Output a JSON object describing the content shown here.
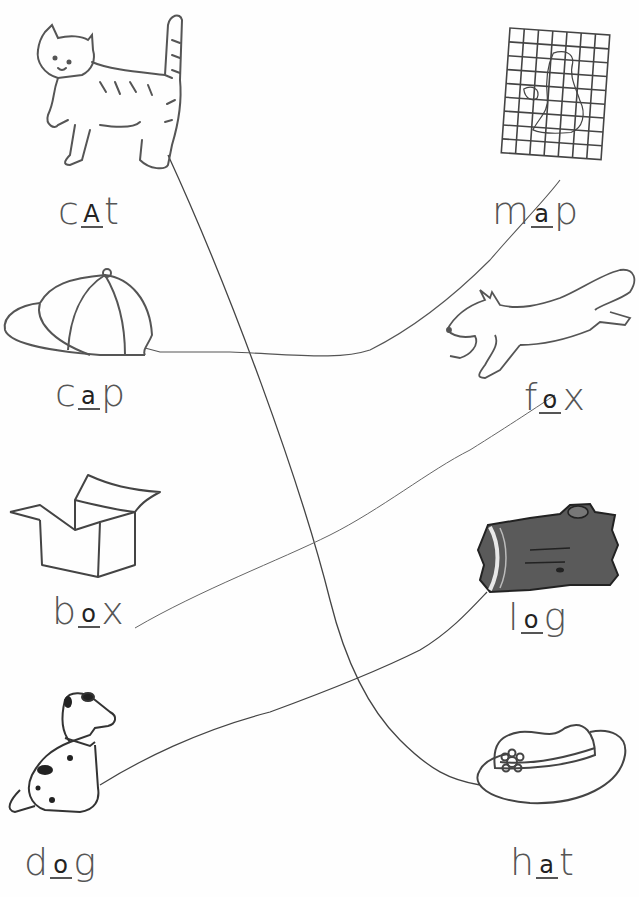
{
  "worksheet": {
    "left_items": [
      {
        "id": "cat",
        "picture": "cat-icon",
        "prefix": "c",
        "blank": "a",
        "suffix": "t",
        "written": "A"
      },
      {
        "id": "cap",
        "picture": "baseball-cap-icon",
        "prefix": "c",
        "blank": "a",
        "suffix": "p",
        "written": "a"
      },
      {
        "id": "box",
        "picture": "box-icon",
        "prefix": "b",
        "blank": "o",
        "suffix": "x",
        "written": "o"
      },
      {
        "id": "dog",
        "picture": "dog-icon",
        "prefix": "d",
        "blank": "o",
        "suffix": "g",
        "written": "o"
      }
    ],
    "right_items": [
      {
        "id": "map",
        "picture": "map-icon",
        "prefix": "m",
        "blank": "a",
        "suffix": "p",
        "written": "a"
      },
      {
        "id": "fox",
        "picture": "fox-icon",
        "prefix": "f",
        "blank": "o",
        "suffix": "x",
        "written": "o"
      },
      {
        "id": "log",
        "picture": "log-icon",
        "prefix": "l",
        "blank": "o",
        "suffix": "g",
        "written": "o"
      },
      {
        "id": "hat",
        "picture": "sun-hat-icon",
        "prefix": "h",
        "blank": "a",
        "suffix": "t",
        "written": "a"
      }
    ],
    "matches": [
      {
        "from": "cat",
        "to": "hat"
      },
      {
        "from": "cap",
        "to": "map"
      },
      {
        "from": "box",
        "to": "fox"
      },
      {
        "from": "dog",
        "to": "log"
      }
    ]
  },
  "colors": {
    "ink": "#555555",
    "pencil": "#333333",
    "log_fill": "#5a5a5a",
    "paper": "#fefefe"
  }
}
